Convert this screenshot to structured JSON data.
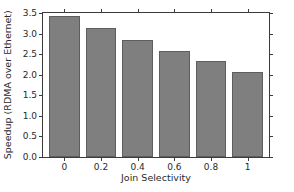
{
  "chart_data": {
    "type": "bar",
    "title": "",
    "xlabel": "Join Selectivity",
    "ylabel": "Speedup (RDMA over Ethernet)",
    "categories": [
      "0",
      "0.2",
      "0.4",
      "0.6",
      "0.8",
      "1"
    ],
    "values": [
      3.42,
      3.13,
      2.84,
      2.58,
      2.34,
      2.07
    ],
    "ylim": [
      0.0,
      3.5
    ],
    "yticks": [
      "0.0",
      "0.5",
      "1.0",
      "1.5",
      "2.0",
      "2.5",
      "3.0",
      "3.5"
    ],
    "ytick_values": [
      0.0,
      0.5,
      1.0,
      1.5,
      2.0,
      2.5,
      3.0,
      3.5
    ],
    "grid": false,
    "legend": null,
    "bar_color": "#7f7f7f",
    "bar_edge_color": "#5e5e5e",
    "axis_color": "#3b3b3b",
    "background": "#ffffff"
  }
}
